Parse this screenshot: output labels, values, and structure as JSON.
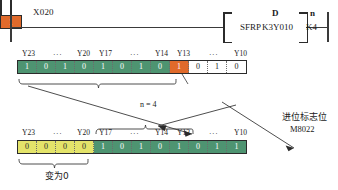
{
  "ladder": {
    "contact": {
      "label": "X020",
      "type": "normally-open-contact"
    },
    "instruction": {
      "name": "SFRP",
      "operands": [
        {
          "head": "D",
          "value": "K3Y010"
        },
        {
          "head": "n",
          "value": "K4"
        }
      ]
    }
  },
  "rows": {
    "top": {
      "labels": [
        "Y23",
        "···",
        "Y20",
        "Y17",
        "···",
        "Y14",
        "Y13",
        "···",
        "Y10"
      ],
      "cells": [
        {
          "value": "1",
          "color": "green"
        },
        {
          "value": "0",
          "color": "green"
        },
        {
          "value": "1",
          "color": "green"
        },
        {
          "value": "0",
          "color": "green"
        },
        {
          "value": "1",
          "color": "green"
        },
        {
          "value": "0",
          "color": "green"
        },
        {
          "value": "1",
          "color": "green"
        },
        {
          "value": "0",
          "color": "green"
        },
        {
          "value": "1",
          "color": "orange"
        },
        {
          "value": "0",
          "color": "white"
        },
        {
          "value": "1",
          "color": "white"
        },
        {
          "value": "0",
          "color": "white"
        }
      ]
    },
    "bottom": {
      "labels": [
        "Y23",
        "···",
        "Y20",
        "Y17",
        "···",
        "Y14",
        "Y13",
        "···",
        "Y10"
      ],
      "cells": [
        {
          "value": "0",
          "color": "yellow"
        },
        {
          "value": "0",
          "color": "yellow"
        },
        {
          "value": "0",
          "color": "yellow"
        },
        {
          "value": "0",
          "color": "yellow"
        },
        {
          "value": "1",
          "color": "green"
        },
        {
          "value": "0",
          "color": "green"
        },
        {
          "value": "1",
          "color": "green"
        },
        {
          "value": "0",
          "color": "green"
        },
        {
          "value": "1",
          "color": "green"
        },
        {
          "value": "0",
          "color": "green"
        },
        {
          "value": "1",
          "color": "green"
        },
        {
          "value": "1",
          "color": "green"
        }
      ]
    }
  },
  "annotations": {
    "shift_amount": "n = 4",
    "becomes_zero": "变为0",
    "carry_flag_title": "进位标志位",
    "carry_flag_id": "M8022",
    "carry_flag_value": "1"
  },
  "colors": {
    "green": "#4e9471",
    "orange": "#e06a2b",
    "yellow": "#e4e46a",
    "white": "#ffffff",
    "ink": "#2b2b2b"
  }
}
